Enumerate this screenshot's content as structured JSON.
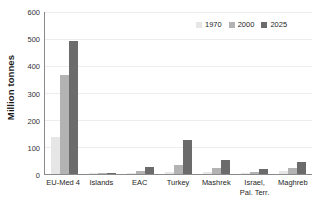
{
  "chart_data": {
    "type": "bar",
    "title": "",
    "subtitle": "",
    "xlabel": "",
    "ylabel": "Million tonnes",
    "ylim": [
      0,
      600
    ],
    "yticks": [
      600,
      500,
      400,
      300,
      200,
      100,
      0
    ],
    "ytick_labels": [
      "600",
      "500",
      "400",
      "300",
      "200",
      "100",
      "0"
    ],
    "grid": true,
    "grid_axis": "y",
    "legend_position": "top-right",
    "categories": [
      "EU-Med 4",
      "Islands",
      "EAC",
      "Turkey",
      "Mashrek",
      "Israel, Pal. Terr.",
      "Maghreb"
    ],
    "category_labels": [
      {
        "line1": "EU-Med 4",
        "line2": ""
      },
      {
        "line1": "Islands",
        "line2": ""
      },
      {
        "line1": "EAC",
        "line2": ""
      },
      {
        "line1": "Turkey",
        "line2": ""
      },
      {
        "line1": "Mashrek",
        "line2": ""
      },
      {
        "line1": "Israel,",
        "line2": "Pal. Terr."
      },
      {
        "line1": "Maghreb",
        "line2": ""
      }
    ],
    "series": [
      {
        "name": "1970",
        "color": "#e6e6e6",
        "values": [
          136,
          1,
          4,
          9,
          8,
          3,
          10
        ]
      },
      {
        "name": "2000",
        "color": "#b3b3b3",
        "values": [
          368,
          2,
          13,
          33,
          23,
          7,
          22
        ]
      },
      {
        "name": "2025",
        "color": "#6b6b6b",
        "values": [
          491,
          4,
          25,
          125,
          53,
          17,
          45
        ]
      }
    ]
  },
  "legend": {
    "items": [
      {
        "label": "1970",
        "color": "#e6e6e6"
      },
      {
        "label": "2000",
        "color": "#b3b3b3"
      },
      {
        "label": "2025",
        "color": "#6b6b6b"
      }
    ]
  },
  "axis": {
    "y_title": "Million tonnes"
  }
}
